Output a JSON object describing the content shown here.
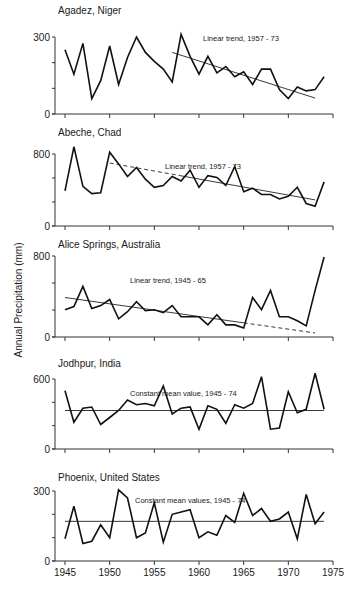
{
  "chart_data": {
    "type": "line",
    "ylabel": "Annual Precipitation (mm)",
    "xlabel": "",
    "x_ticks": [
      1945,
      1950,
      1955,
      1960,
      1965,
      1970,
      1975
    ],
    "xlim": [
      1944,
      1975
    ],
    "x": [
      1945,
      1946,
      1947,
      1948,
      1949,
      1950,
      1951,
      1952,
      1953,
      1954,
      1955,
      1956,
      1957,
      1958,
      1959,
      1960,
      1961,
      1962,
      1963,
      1964,
      1965,
      1966,
      1967,
      1968,
      1969,
      1970,
      1971,
      1972,
      1973,
      1974
    ],
    "panels": [
      {
        "title": "Agadez, Niger",
        "ymax": 300,
        "y_ticks": [
          0,
          300
        ],
        "trend_label": "Linear trend, 1957 - 73",
        "trend": {
          "type": "linear",
          "x0": 1957,
          "y0": 240,
          "x1": 1973,
          "y1": 62,
          "dashed_from": null
        },
        "values": [
          250,
          155,
          275,
          60,
          130,
          265,
          115,
          220,
          300,
          240,
          205,
          175,
          125,
          310,
          225,
          155,
          225,
          160,
          185,
          145,
          165,
          115,
          175,
          175,
          95,
          60,
          105,
          90,
          95,
          145
        ]
      },
      {
        "title": "Abeche, Chad",
        "ymax": 800,
        "y_ticks": [
          0,
          800
        ],
        "trend_label": "Linear trend, 1957 - 73",
        "trend": {
          "type": "linear",
          "x0": 1950,
          "y0": 700,
          "x1": 1973,
          "y1": 290,
          "dashed_from_to": [
            1950,
            1958
          ]
        },
        "values": [
          390,
          880,
          440,
          360,
          370,
          820,
          690,
          550,
          650,
          520,
          430,
          450,
          550,
          500,
          620,
          430,
          560,
          540,
          450,
          660,
          380,
          420,
          350,
          350,
          300,
          330,
          430,
          250,
          220,
          490
        ]
      },
      {
        "title": "Alice Springs, Australia",
        "ymax": 800,
        "y_ticks": [
          0,
          800
        ],
        "trend_label": "Linear trend, 1945 - 65",
        "trend": {
          "type": "linear",
          "x0": 1945,
          "y0": 390,
          "x1": 1965,
          "y1": 140,
          "dashed_extension_to": [
            1973,
            40
          ]
        },
        "values": [
          270,
          300,
          500,
          280,
          310,
          370,
          180,
          250,
          350,
          260,
          270,
          240,
          310,
          200,
          200,
          200,
          120,
          220,
          120,
          120,
          90,
          390,
          270,
          460,
          200,
          200,
          160,
          110,
          460,
          790
        ]
      },
      {
        "title": "Jodhpur, India",
        "ymax": 600,
        "y_ticks": [
          0,
          600
        ],
        "trend_label": "Constant mean value, 1945 - 74",
        "trend": {
          "type": "constant",
          "value": 330,
          "x0": 1945,
          "x1": 1974
        },
        "values": [
          500,
          230,
          350,
          360,
          210,
          270,
          330,
          420,
          380,
          390,
          370,
          540,
          300,
          350,
          360,
          170,
          370,
          340,
          220,
          380,
          350,
          390,
          620,
          170,
          180,
          490,
          310,
          340,
          650,
          340
        ]
      },
      {
        "title": "Phoenix, United States",
        "ymax": 300,
        "y_ticks": [
          0,
          300
        ],
        "trend_label": "Constant mean values, 1945 - 74",
        "trend": {
          "type": "constant",
          "value": 170,
          "x0": 1945,
          "x1": 1974
        },
        "values": [
          95,
          235,
          75,
          85,
          155,
          100,
          305,
          270,
          100,
          120,
          250,
          80,
          200,
          210,
          220,
          100,
          125,
          110,
          195,
          165,
          290,
          195,
          225,
          170,
          180,
          210,
          95,
          285,
          160,
          210
        ]
      }
    ]
  }
}
